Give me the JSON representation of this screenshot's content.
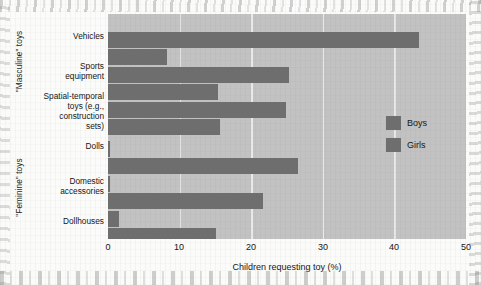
{
  "chart_data": {
    "type": "bar",
    "orientation": "horizontal",
    "title": "",
    "xlabel": "Children requesting toy (%)",
    "ylabel": "",
    "xlim": [
      0,
      50
    ],
    "xticks": [
      0,
      10,
      20,
      30,
      40,
      50
    ],
    "xtick_labels": [
      "0",
      "10",
      "20",
      "30",
      "40",
      "50"
    ],
    "grid": "vertical",
    "legend_position": "right",
    "categories": [
      "Vehicles",
      "Sports\nequipment",
      "Spatial-temporal\ntoys (e.g.,\nconstruction\nsets)",
      "Dolls",
      "Domestic\naccessories",
      "Dollhouses"
    ],
    "series": [
      {
        "name": "Boys",
        "color": "#6e6e6e",
        "values": [
          43.5,
          25.3,
          24.8,
          0.3,
          0.3,
          1.5
        ]
      },
      {
        "name": "Girls",
        "color": "#6e6e6e",
        "values": [
          8.3,
          15.4,
          15.7,
          26.5,
          21.7,
          15.1
        ]
      }
    ],
    "group_labels": [
      {
        "text": "\"Masculine\" toys",
        "categories": [
          "Vehicles",
          "Sports equipment",
          "Spatial-temporal toys (e.g., construction sets)"
        ]
      },
      {
        "text": "\"Feminine\" toys",
        "categories": [
          "Dolls",
          "Domestic accessories",
          "Dollhouses"
        ]
      }
    ]
  },
  "axis": {
    "x_title": "Children requesting toy (%)",
    "x_tick_0": "0",
    "x_tick_1": "10",
    "x_tick_2": "20",
    "x_tick_3": "30",
    "x_tick_4": "40",
    "x_tick_5": "50"
  },
  "categories": {
    "vehicles": "Vehicles",
    "sports_equipment": "Sports\nequipment",
    "spatial_temporal": "Spatial-temporal\ntoys (e.g.,\nconstruction\nsets)",
    "dolls": "Dolls",
    "domestic_accessories": "Domestic\naccessories",
    "dollhouses": "Dollhouses"
  },
  "groups": {
    "masculine": "\"Masculine\" toys",
    "feminine": "\"Feminine\" toys"
  },
  "legend": {
    "boys": "Boys",
    "girls": "Girls"
  },
  "colors": {
    "bar": "#6e6e6e",
    "plot_background": "#c2c2c2",
    "gridline": "#e9e9e9",
    "page_background": "#fbfbfa"
  }
}
